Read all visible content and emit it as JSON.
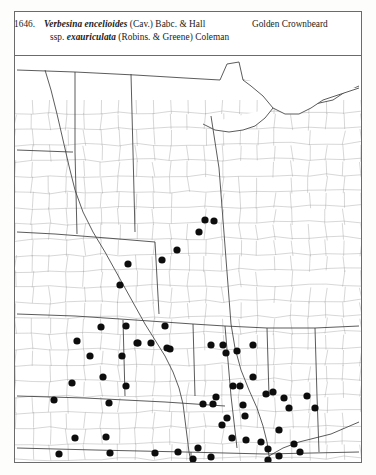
{
  "page": {
    "entry_number": "1646.",
    "background_color": "#fdfdfc",
    "frame_color": "#6b6b6b"
  },
  "caption": {
    "number": "1646.",
    "genus_species": "Verbesina encelioides",
    "species_authority": "(Cav.) Babc. & Hall",
    "subspecies_prefix": "ssp.",
    "subspecies": "exauriculata",
    "subspecies_authority": "(Robins. & Greene) Coleman",
    "common_name": "Golden Crownbeard"
  },
  "map": {
    "title": "county-level distribution map",
    "region": "Great Plains and Midwest United States",
    "dot_color": "#0d0d0d",
    "dot_radius": 3.6,
    "county_line_color": "#9a9a9a",
    "state_line_color": "#3d3d3d",
    "occurrence_count": 62
  },
  "chart_data": {
    "type": "scatter",
    "xlabel": "",
    "ylabel": "",
    "grid": false,
    "legend": null,
    "xlim": [
      0,
      346
    ],
    "ylim": [
      0,
      406
    ],
    "series": [
      {
        "name": "county occurrence records",
        "marker": "filled-circle",
        "color": "#0d0d0d",
        "points": [
          [
            190,
            164
          ],
          [
            199,
            165
          ],
          [
            113,
            208
          ],
          [
            147,
            204
          ],
          [
            162,
            194
          ],
          [
            184,
            176
          ],
          [
            105,
            229
          ],
          [
            86,
            271
          ],
          [
            111,
            270
          ],
          [
            62,
            285
          ],
          [
            75,
            300
          ],
          [
            107,
            300
          ],
          [
            150,
            270
          ],
          [
            152,
            292
          ],
          [
            88,
            321
          ],
          [
            122,
            287
          ],
          [
            123,
            287
          ],
          [
            136,
            287
          ],
          [
            155,
            293
          ],
          [
            238,
            289
          ],
          [
            111,
            330
          ],
          [
            196,
            289
          ],
          [
            208,
            289
          ],
          [
            39,
            344
          ],
          [
            57,
            327
          ],
          [
            60,
            382
          ],
          [
            44,
            398
          ],
          [
            211,
            297
          ],
          [
            222,
            295
          ],
          [
            225,
            330
          ],
          [
            201,
            341
          ],
          [
            188,
            348
          ],
          [
            198,
            348
          ],
          [
            94,
            347
          ],
          [
            218,
            330
          ],
          [
            91,
            381
          ],
          [
            95,
            397
          ],
          [
            212,
            362
          ],
          [
            230,
            360
          ],
          [
            258,
            336
          ],
          [
            269,
            342
          ],
          [
            274,
            352
          ],
          [
            292,
            340
          ],
          [
            300,
            352
          ],
          [
            238,
            321
          ],
          [
            251,
            338
          ],
          [
            217,
            382
          ],
          [
            231,
            384
          ],
          [
            246,
            386
          ],
          [
            253,
            393
          ],
          [
            183,
            392
          ],
          [
            178,
            403
          ],
          [
            196,
            401
          ],
          [
            253,
            404
          ],
          [
            264,
            400
          ],
          [
            228,
            349
          ],
          [
            207,
            369
          ],
          [
            264,
            374
          ],
          [
            279,
            388
          ],
          [
            285,
            396
          ],
          [
            140,
            397
          ],
          [
            163,
            396
          ]
        ]
      }
    ]
  }
}
